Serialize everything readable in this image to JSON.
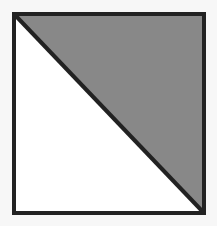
{
  "diagram": {
    "type": "square-split-diagonal",
    "square": {
      "x": 14,
      "y": 14,
      "width": 190,
      "height": 199
    },
    "shaded_triangle": {
      "region": "upper-right",
      "fill": "#888888"
    },
    "unshaded_triangle": {
      "region": "lower-left",
      "fill": "#ffffff"
    },
    "stroke_color": "#222222",
    "stroke_width": 4,
    "background": "#f7f7f7"
  }
}
